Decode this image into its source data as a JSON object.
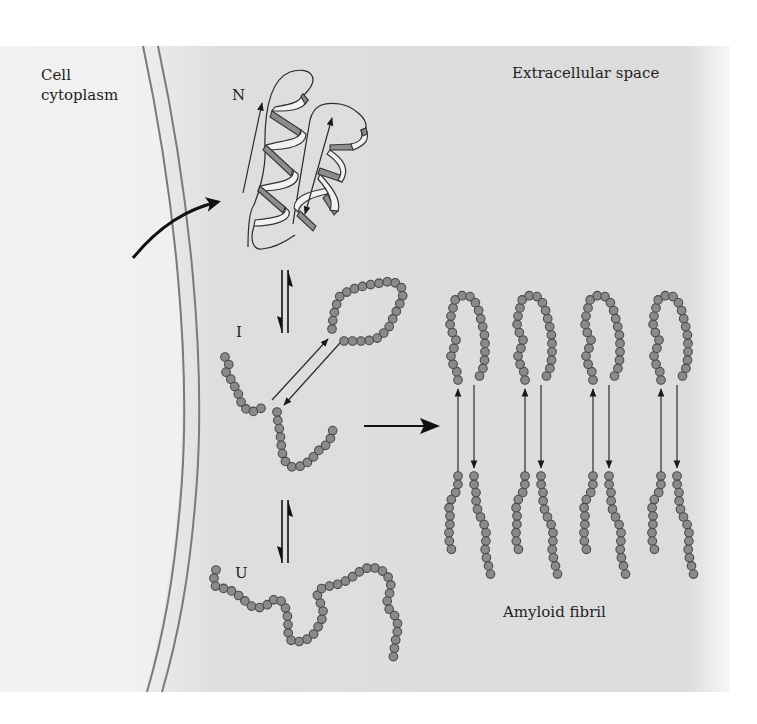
{
  "figure": {
    "background": "#ffffff",
    "panel_color_left": "#f3f3f3",
    "panel_color_right": "#dcdcdc",
    "bead_fill": "#8a8a8a",
    "bead_stroke": "#4a4a4a"
  },
  "labels": {
    "cytoplasm_line1": "Cell",
    "cytoplasm_line2": "cytoplasm",
    "extracellular": "Extracellular space",
    "state_native": "N",
    "state_intermediate": "I",
    "state_unfolded": "U",
    "fibril": "Amyloid fibril"
  },
  "arrows": {
    "secretion": "curved arrow from cytoplasm to native protein",
    "equilibrium_n_i": "N ⇌ I",
    "equilibrium_i_u": "I ⇌ U",
    "aggregation": "I → Amyloid fibril"
  },
  "fibril": {
    "strand_count": 4
  }
}
